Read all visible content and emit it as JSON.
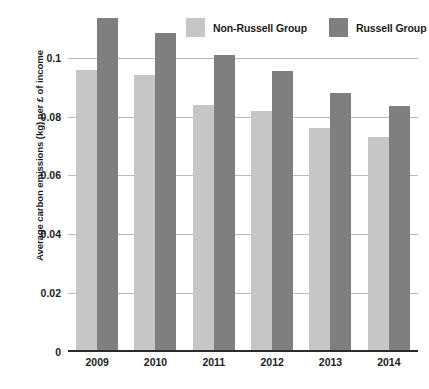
{
  "chart_data": {
    "type": "bar",
    "title": "",
    "subtitle": "",
    "xlabel": "",
    "ylabel": "Average carbon emissions (kg) per £ of income",
    "categories": [
      "2009",
      "2010",
      "2011",
      "2012",
      "2013",
      "2014"
    ],
    "series": [
      {
        "name": "Non-Russell Group",
        "color": "#c6c6c6",
        "values": [
          0.096,
          0.094,
          0.084,
          0.082,
          0.076,
          0.073
        ]
      },
      {
        "name": "Russell Group",
        "color": "#7f7f7f",
        "values": [
          0.1135,
          0.1085,
          0.101,
          0.0955,
          0.088,
          0.0835
        ]
      }
    ],
    "ylim": [
      0,
      0.1115
    ],
    "yticks": [
      0,
      0.02,
      0.04,
      0.06,
      0.08,
      0.1
    ],
    "ytick_labels": [
      "0",
      "0.02",
      "0.04",
      "0.06",
      "0.08",
      "0.1"
    ],
    "grid": true,
    "grid_axis": "y",
    "legend_position": "top-right",
    "background": "#ffffff",
    "axis_color": "#2b2b2b",
    "gridline_color": "#b9b9b9"
  },
  "legend": {
    "entries": [
      {
        "label": "Non-Russell Group",
        "color": "#c6c6c6"
      },
      {
        "label": "Russell Group",
        "color": "#7f7f7f"
      }
    ]
  }
}
